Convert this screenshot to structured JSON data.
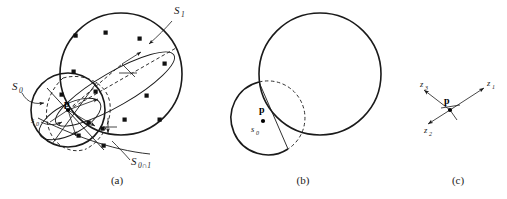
{
  "figure": {
    "background_color": "#ffffff",
    "stroke_color": "#1a1a1a",
    "width": 507,
    "height": 199
  },
  "panels": [
    {
      "id": "a",
      "caption": "(a)",
      "caption_x": 117,
      "caption_y": 184,
      "description": "Large circle S1 overlapping smaller circle S0 with scattered square sample points, dashed construction arcs, an elongated ellipse and local coordinate frames at point p",
      "labels": [
        {
          "name": "s-one-label",
          "base": "S",
          "sub": "1",
          "x": 174,
          "y": 14
        },
        {
          "name": "s-zero-label",
          "base": "S",
          "sub": "0",
          "x": 12,
          "y": 90
        },
        {
          "name": "s-zero-small-label",
          "base": "s",
          "sub": "0",
          "x": 31,
          "y": 123
        },
        {
          "name": "s-zero-cap-one-label",
          "base": "S",
          "sub": "0∩1",
          "x": 131,
          "y": 165
        },
        {
          "name": "point-p-label",
          "base": "p",
          "sub": "",
          "x": 68,
          "y": 110
        }
      ],
      "shapes": {
        "big_circle": {
          "cx": 121,
          "cy": 74,
          "r": 61
        },
        "small_circle": {
          "cx": 68,
          "cy": 110,
          "r": 37
        }
      },
      "sample_points": [
        {
          "x": 76,
          "y": 36
        },
        {
          "x": 106,
          "y": 33
        },
        {
          "x": 74,
          "y": 72
        },
        {
          "x": 96,
          "y": 92
        },
        {
          "x": 147,
          "y": 96
        },
        {
          "x": 160,
          "y": 120
        },
        {
          "x": 165,
          "y": 64
        },
        {
          "x": 62,
          "y": 95
        },
        {
          "x": 89,
          "y": 123
        },
        {
          "x": 103,
          "y": 129
        },
        {
          "x": 79,
          "y": 136
        },
        {
          "x": 104,
          "y": 146
        },
        {
          "x": 125,
          "y": 120
        },
        {
          "x": 140,
          "y": 39
        }
      ]
    },
    {
      "id": "b",
      "caption": "(b)",
      "caption_x": 303,
      "caption_y": 184,
      "description": "Large solid circle overlapping a smaller solid circle whose hidden overlap boundary is drawn dashed, with a chord through point p",
      "labels": [
        {
          "name": "point-p-label",
          "base": "p",
          "sub": "",
          "x": 262,
          "y": 112
        },
        {
          "name": "s-zero-small-label",
          "base": "s",
          "sub": "0",
          "x": 251,
          "y": 130
        }
      ],
      "shapes": {
        "big_circle": {
          "cx": 320,
          "cy": 74,
          "r": 61
        },
        "small_circle": {
          "cx": 258,
          "cy": 119,
          "r": 37
        }
      }
    },
    {
      "id": "c",
      "caption": "(c)",
      "caption_x": 458,
      "caption_y": 184,
      "description": "Local coordinate frame at point p with three labeled axis arrows",
      "labels": [
        {
          "name": "point-p-label",
          "base": "p",
          "sub": "",
          "x": 444,
          "y": 101
        },
        {
          "name": "z-one-axis-label",
          "base": "z",
          "sub": "1",
          "x": 487,
          "y": 86
        },
        {
          "name": "z-two-axis-label",
          "base": "z",
          "sub": "2",
          "x": 428,
          "y": 129
        },
        {
          "name": "z-three-axis-label",
          "base": "z",
          "sub": "3",
          "x": 427,
          "y": 88
        }
      ],
      "origin": {
        "x": 450,
        "y": 110
      },
      "axes": [
        {
          "name": "z1",
          "x2": 484,
          "y2": 88
        },
        {
          "name": "z2",
          "x2": 428,
          "y2": 124
        },
        {
          "name": "z3",
          "x2": 424,
          "y2": 90
        }
      ]
    }
  ]
}
